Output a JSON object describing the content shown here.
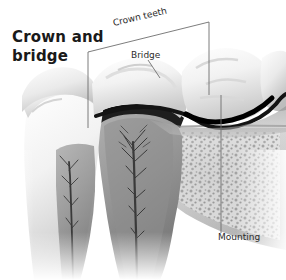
{
  "figure": {
    "title": "Crown and bridge",
    "title_line1": "Crown and",
    "title_line2": "bridge",
    "style": "grayscale medical illustration",
    "background_color": "#ffffff",
    "text_color": "#2b2b2b"
  },
  "labels": {
    "crown_teeth": "Crown teeth",
    "bridge": "Bridge",
    "mounting": "Mounting"
  },
  "callouts": [
    {
      "name": "crown-teeth",
      "label": "Crown teeth",
      "leader": "diagonal bracket with vertical drop lines at both ends"
    },
    {
      "name": "bridge",
      "label": "Bridge",
      "leader": "short diagonal leader down-right"
    },
    {
      "name": "mounting",
      "label": "Mounting",
      "leader": "vertical leader line upward"
    }
  ]
}
